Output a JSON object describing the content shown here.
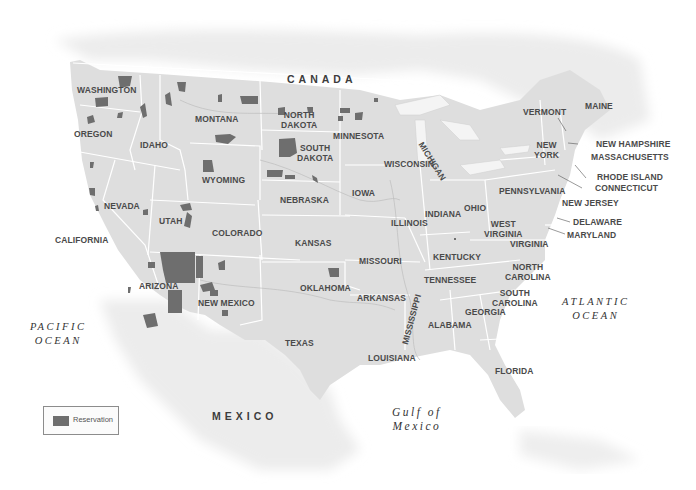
{
  "map": {
    "title": "Indian Reservations in the contiguous United States",
    "colors": {
      "land_us": "#dedede",
      "land_other": "#ececec",
      "state_border": "#ffffff",
      "reservation": "#6e6e6e",
      "water": "#ffffff",
      "label": "#4a4a4a"
    },
    "countries": {
      "canada": "CANADA",
      "mexico": "MEXICO"
    },
    "water_bodies": {
      "pacific_line1": "PACIFIC",
      "pacific_line2": "OCEAN",
      "atlantic_line1": "ATLANTIC",
      "atlantic_line2": "OCEAN",
      "gulf_line1": "Gulf of",
      "gulf_line2": "Mexico"
    },
    "states": {
      "washington": "WASHINGTON",
      "oregon": "OREGON",
      "california": "CALIFORNIA",
      "idaho": "IDAHO",
      "nevada": "NEVADA",
      "montana": "MONTANA",
      "wyoming": "WYOMING",
      "utah": "UTAH",
      "arizona": "ARIZONA",
      "colorado": "COLORADO",
      "new_mexico": "NEW MEXICO",
      "north_dakota_1": "NORTH",
      "north_dakota_2": "DAKOTA",
      "south_dakota_1": "SOUTH",
      "south_dakota_2": "DAKOTA",
      "nebraska": "NEBRASKA",
      "kansas": "KANSAS",
      "oklahoma": "OKLAHOMA",
      "texas": "TEXAS",
      "minnesota": "MINNESOTA",
      "iowa": "IOWA",
      "missouri": "MISSOURI",
      "arkansas": "ARKANSAS",
      "louisiana": "LOUISIANA",
      "wisconsin": "WISCONSIN",
      "michigan": "MICHIGAN",
      "illinois": "ILLINOIS",
      "indiana": "INDIANA",
      "ohio": "OHIO",
      "kentucky": "KENTUCKY",
      "tennessee": "TENNESSEE",
      "mississippi": "MISSISSIPPI",
      "alabama": "ALABAMA",
      "georgia": "GEORGIA",
      "florida": "FLORIDA",
      "south_carolina_1": "SOUTH",
      "south_carolina_2": "CAROLINA",
      "north_carolina_1": "NORTH",
      "north_carolina_2": "CAROLINA",
      "virginia": "VIRGINIA",
      "west_virginia_1": "WEST",
      "west_virginia_2": "VIRGINIA",
      "pennsylvania": "PENNSYLVANIA",
      "new_york_1": "NEW",
      "new_york_2": "YORK",
      "vermont": "VERMONT",
      "maine": "MAINE",
      "new_hampshire": "NEW HAMPSHIRE",
      "massachusetts": "MASSACHUSETTS",
      "rhode_island": "RHODE ISLAND",
      "connecticut": "CONNECTICUT",
      "new_jersey": "NEW JERSEY",
      "delaware": "DELAWARE",
      "maryland": "MARYLAND"
    },
    "legend": {
      "items": [
        {
          "label": "Reservation",
          "color": "#6e6e6e"
        }
      ]
    }
  }
}
